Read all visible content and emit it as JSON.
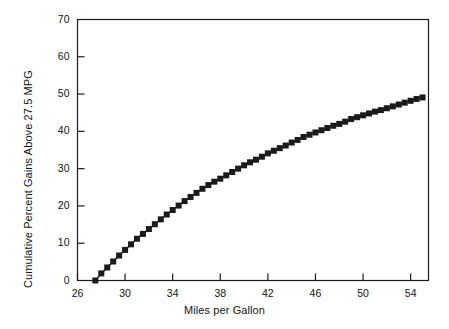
{
  "chart_data": {
    "type": "line",
    "title": "",
    "xlabel": "Miles per Gallon",
    "ylabel": "Cumulative Percent Gains Above 27.5 MPG",
    "xlim": [
      26,
      55.5
    ],
    "ylim": [
      0,
      70
    ],
    "xticks": [
      26,
      30,
      34,
      38,
      42,
      46,
      50,
      54
    ],
    "yticks": [
      0,
      10,
      20,
      30,
      40,
      50,
      60,
      70
    ],
    "xtick_labels": [
      "26",
      "30",
      "34",
      "38",
      "42",
      "46",
      "50",
      "54"
    ],
    "ytick_labels": [
      "0",
      "10",
      "20",
      "30",
      "40",
      "50",
      "60",
      "70"
    ],
    "grid": false,
    "legend": false,
    "marker": "filled-square",
    "line_color": "#1a1a1a",
    "marker_color": "#1a1a1a",
    "series": [
      {
        "name": "Cumulative Percent Gains",
        "x": [
          27.5,
          28.0,
          28.5,
          29.0,
          29.5,
          30.0,
          30.5,
          31.0,
          31.5,
          32.0,
          32.5,
          33.0,
          33.5,
          34.0,
          34.5,
          35.0,
          35.5,
          36.0,
          36.5,
          37.0,
          37.5,
          38.0,
          38.5,
          39.0,
          39.5,
          40.0,
          40.5,
          41.0,
          41.5,
          42.0,
          42.5,
          43.0,
          43.5,
          44.0,
          44.5,
          45.0,
          45.5,
          46.0,
          46.5,
          47.0,
          47.5,
          48.0,
          48.5,
          49.0,
          49.5,
          50.0,
          50.5,
          51.0,
          51.5,
          52.0,
          52.5,
          53.0,
          53.5,
          54.0,
          54.5,
          55.0
        ],
        "y": [
          0.0,
          1.9,
          3.5,
          5.1,
          6.7,
          8.2,
          9.7,
          11.2,
          12.5,
          13.8,
          15.1,
          16.4,
          17.7,
          18.9,
          20.1,
          21.3,
          22.4,
          23.5,
          24.6,
          25.6,
          26.5,
          27.3,
          28.2,
          29.1,
          30.0,
          30.9,
          31.7,
          32.4,
          33.2,
          34.1,
          34.8,
          35.5,
          36.2,
          37.0,
          37.7,
          38.5,
          39.1,
          39.7,
          40.3,
          40.9,
          41.5,
          42.0,
          42.6,
          43.3,
          43.8,
          44.3,
          44.8,
          45.3,
          45.7,
          46.2,
          46.7,
          47.2,
          47.7,
          48.2,
          48.7,
          49.1
        ]
      }
    ]
  }
}
